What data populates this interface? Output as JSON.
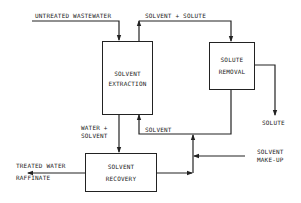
{
  "diagram": {
    "type": "process-flow",
    "colors": {
      "line": "#222222",
      "background": "#ffffff"
    },
    "nodes": {
      "solvent_extraction": {
        "line1": "SOLVENT",
        "line2": "EXTRACTION"
      },
      "solute_removal": {
        "line1": "SOLUTE",
        "line2": "REMOVAL"
      },
      "solvent_recovery": {
        "line1": "SOLVENT",
        "line2": "RECOVERY"
      }
    },
    "labels": {
      "untreated_wastewater": "UNTREATED WASTEWATER",
      "solvent_plus_solute": "SOLVENT + SOLUTE",
      "solute": "SOLUTE",
      "water_plus_solvent_1": "WATER +",
      "water_plus_solvent_2": "SOLVENT",
      "solvent": "SOLVENT",
      "solvent_makeup_1": "SOLVENT",
      "solvent_makeup_2": "MAKE-UP",
      "treated_water": "TREATED WATER",
      "raffinate": "RAFFINATE"
    },
    "edges": [
      {
        "from": "untreated_wastewater",
        "to": "solvent_extraction"
      },
      {
        "from": "solvent_extraction",
        "to": "solute_removal",
        "label": "SOLVENT + SOLUTE"
      },
      {
        "from": "solute_removal",
        "to": "solute"
      },
      {
        "from": "solute_removal",
        "to": "solvent_extraction",
        "label": "SOLVENT"
      },
      {
        "from": "solvent_extraction",
        "to": "solvent_recovery",
        "label": "WATER + SOLVENT"
      },
      {
        "from": "solvent_recovery",
        "to": "treated_water_raffinate"
      },
      {
        "from": "solvent_recovery",
        "to": "solvent_extraction"
      },
      {
        "from": "solvent_makeup",
        "to": "solvent_return_line"
      }
    ]
  }
}
